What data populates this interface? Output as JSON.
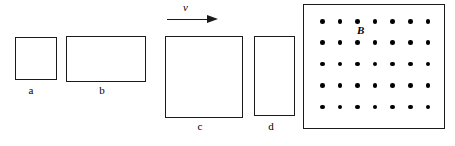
{
  "figure": {
    "background_color": "#ffffff",
    "stroke_color": "#1a1a1a",
    "dot_color": "#000000",
    "width": 455,
    "height": 146
  },
  "plates": [
    {
      "label": "a",
      "shape": "square",
      "x": 15,
      "y": 37,
      "width": 42,
      "height": 43,
      "label_x": 31,
      "label_y": 84
    },
    {
      "label": "b",
      "shape": "rectangle-wide",
      "x": 66,
      "y": 36,
      "width": 80,
      "height": 46,
      "label_x": 102,
      "label_y": 84
    },
    {
      "label": "c",
      "shape": "square-large",
      "x": 165,
      "y": 36,
      "width": 78,
      "height": 82,
      "label_x": 200,
      "label_y": 120
    },
    {
      "label": "d",
      "shape": "rectangle-tall",
      "x": 254,
      "y": 36,
      "width": 41,
      "height": 80,
      "label_x": 271,
      "label_y": 120
    }
  ],
  "velocity": {
    "label": "v",
    "arrow_direction": "right"
  },
  "field": {
    "label": "B",
    "direction": "out-of-page",
    "marker": "dot",
    "columns": 7,
    "rows": 5,
    "dot_count": 35,
    "grid_origin_x": 16,
    "grid_origin_y": 14,
    "col_spacing": 17.6,
    "row_spacing": 21.4,
    "region": {
      "x": 303,
      "y": 4,
      "width": 142,
      "height": 125
    }
  }
}
